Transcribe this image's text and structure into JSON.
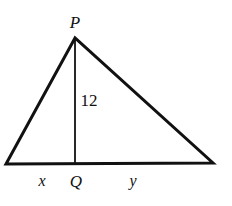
{
  "figure": {
    "type": "geometry-diagram",
    "shape": "triangle-with-altitude",
    "background_color": "#ffffff",
    "stroke_color": "#111111",
    "text_color": "#111111",
    "canvas": {
      "width": 232,
      "height": 206
    },
    "vertices": {
      "apex": {
        "label": "P",
        "x": 75,
        "y": 38
      },
      "base_left": {
        "label": "",
        "x": 6,
        "y": 164
      },
      "base_right": {
        "label": "",
        "x": 213,
        "y": 163
      },
      "altitude_foot": {
        "label": "Q",
        "x": 75,
        "y": 164
      }
    },
    "edges": [
      {
        "name": "left-side",
        "from": "apex",
        "to": "base_left",
        "stroke_width": 3
      },
      {
        "name": "right-side",
        "from": "apex",
        "to": "base_right",
        "stroke_width": 3
      },
      {
        "name": "base",
        "from": "base_left",
        "to": "base_right",
        "stroke_width": 3
      },
      {
        "name": "altitude",
        "from": "apex",
        "to": "altitude_foot",
        "stroke_width": 1.8
      }
    ],
    "labels": {
      "apex": "P",
      "altitude_foot": "Q",
      "altitude_length": "12",
      "base_segment_left": "x",
      "base_segment_right": "y"
    }
  }
}
